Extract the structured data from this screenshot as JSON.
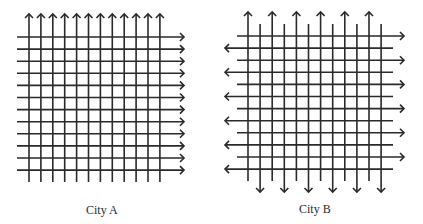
{
  "colors": {
    "line": "#2a2a2a",
    "background": "#ffffff"
  },
  "diagrams": [
    {
      "id": "city-a",
      "label": "City A",
      "label_pos": {
        "x": 86,
        "y": 203
      },
      "grid": {
        "vertical_count": 12,
        "vertical_x_start": 29,
        "vertical_spacing": 11.9,
        "vertical_pattern": "all-up",
        "vertical_top": 14,
        "vertical_bottom": 182,
        "horizontal_count": 12,
        "horizontal_y_start": 37,
        "horizontal_spacing": 12.1,
        "horizontal_pattern": "all-right",
        "horizontal_left": 17,
        "horizontal_right": 184
      }
    },
    {
      "id": "city-b",
      "label": "City B",
      "label_pos": {
        "x": 299,
        "y": 202
      },
      "grid": {
        "vertical_count": 12,
        "vertical_x_start": 248,
        "vertical_spacing": 12.1,
        "vertical_pattern": "alternate-up-down",
        "vertical_up_top": 12,
        "vertical_up_bottom": 181,
        "vertical_down_top": 24,
        "vertical_down_bottom": 192,
        "horizontal_count": 12,
        "horizontal_y_start": 36,
        "horizontal_spacing": 12.1,
        "horizontal_pattern": "alternate-right-left",
        "horizontal_right_left": 237,
        "horizontal_right_right": 404,
        "horizontal_left_left": 225,
        "horizontal_left_right": 393
      }
    }
  ]
}
